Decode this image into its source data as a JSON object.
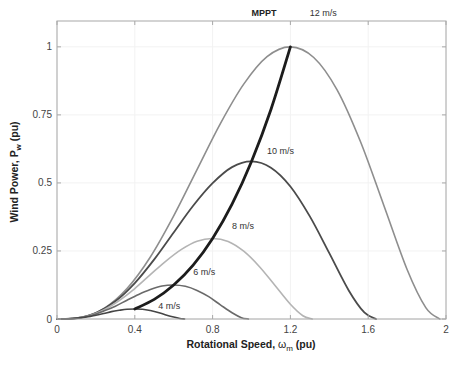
{
  "chart_data": {
    "type": "line",
    "title": "",
    "xlabel": "Rotational Speed, ω_m (pu)",
    "ylabel": "Wind Power, P_w (pu)",
    "xlabel_parts": {
      "main": "Rotational Speed, ",
      "symbol": "ω",
      "sub": "m",
      "unit": " (pu)"
    },
    "ylabel_parts": {
      "main": "Wind Power, P",
      "sub": "w",
      "unit": " (pu)"
    },
    "xlim": [
      0,
      2
    ],
    "ylim": [
      0,
      1.095
    ],
    "xticks": [
      0,
      0.4,
      0.8,
      1.2,
      1.6,
      2
    ],
    "xtick_labels": [
      "0",
      "0.4",
      "0.8",
      "1.2",
      "1.6",
      "2"
    ],
    "yticks": [
      0,
      0.25,
      0.5,
      0.75,
      1
    ],
    "ytick_labels": [
      "0",
      "0.25",
      "0.5",
      "0.75",
      "1"
    ],
    "grid": true,
    "legend": "none (inline labels)",
    "series": [
      {
        "name": "12 m/s",
        "color": "#8e8e8e",
        "width": 1.6,
        "x": [
          0,
          0.12,
          0.24,
          0.36,
          0.48,
          0.6,
          0.72,
          0.84,
          0.96,
          1.08,
          1.2,
          1.32,
          1.44,
          1.56,
          1.68,
          1.8,
          1.896,
          1.968
        ],
        "y": [
          0,
          0.005,
          0.038,
          0.112,
          0.228,
          0.379,
          0.549,
          0.718,
          0.863,
          0.964,
          1.0,
          0.961,
          0.842,
          0.652,
          0.418,
          0.182,
          0.042,
          0
        ]
      },
      {
        "name": "10 m/s",
        "color": "#4b4b4b",
        "width": 1.8,
        "x": [
          0,
          0.1,
          0.2,
          0.3,
          0.4,
          0.5,
          0.6,
          0.7,
          0.8,
          0.9,
          1.0,
          1.1,
          1.2,
          1.3,
          1.4,
          1.5,
          1.58,
          1.64
        ],
        "y": [
          0,
          0.003,
          0.022,
          0.065,
          0.132,
          0.219,
          0.318,
          0.416,
          0.499,
          0.558,
          0.579,
          0.556,
          0.487,
          0.377,
          0.242,
          0.105,
          0.024,
          0
        ]
      },
      {
        "name": "8 m/s",
        "color": "#b4b4b4",
        "width": 1.6,
        "x": [
          0,
          0.08,
          0.16,
          0.24,
          0.32,
          0.4,
          0.48,
          0.56,
          0.64,
          0.72,
          0.8,
          0.88,
          0.96,
          1.04,
          1.12,
          1.2,
          1.264,
          1.312
        ],
        "y": [
          0,
          0.002,
          0.011,
          0.033,
          0.068,
          0.112,
          0.163,
          0.213,
          0.256,
          0.286,
          0.296,
          0.285,
          0.249,
          0.193,
          0.124,
          0.054,
          0.012,
          0
        ]
      },
      {
        "name": "6 m/s",
        "color": "#6a6a6a",
        "width": 1.6,
        "x": [
          0,
          0.06,
          0.12,
          0.18,
          0.24,
          0.3,
          0.36,
          0.42,
          0.48,
          0.54,
          0.6,
          0.66,
          0.72,
          0.78,
          0.84,
          0.9,
          0.948,
          0.984
        ],
        "y": [
          0,
          0.001,
          0.005,
          0.014,
          0.029,
          0.047,
          0.069,
          0.09,
          0.108,
          0.121,
          0.125,
          0.12,
          0.105,
          0.082,
          0.052,
          0.023,
          0.005,
          0
        ]
      },
      {
        "name": "4 m/s",
        "color": "#454545",
        "width": 1.6,
        "x": [
          0,
          0.04,
          0.08,
          0.12,
          0.16,
          0.2,
          0.24,
          0.28,
          0.32,
          0.36,
          0.4,
          0.44,
          0.48,
          0.52,
          0.56,
          0.6,
          0.632,
          0.656
        ],
        "y": [
          0,
          0,
          0.001,
          0.004,
          0.008,
          0.014,
          0.02,
          0.027,
          0.032,
          0.036,
          0.037,
          0.036,
          0.031,
          0.024,
          0.015,
          0.007,
          0.002,
          0
        ]
      },
      {
        "name": "MPPT",
        "color": "#1c1c1c",
        "width": 2.8,
        "x": [
          0.4,
          0.5,
          0.6,
          0.7,
          0.8,
          0.9,
          1.0,
          1.1,
          1.2
        ],
        "y": [
          0.037,
          0.072,
          0.125,
          0.198,
          0.296,
          0.422,
          0.579,
          0.77,
          1.0
        ]
      }
    ],
    "annotations": [
      {
        "text": "MPPT",
        "x": 1.0,
        "y": 1.112,
        "bold": true
      },
      {
        "text": "12 m/s",
        "x": 1.3,
        "y": 1.112,
        "bold": false
      },
      {
        "text": "10 m/s",
        "x": 1.08,
        "y": 0.605,
        "bold": false
      },
      {
        "text": "8 m/s",
        "x": 0.9,
        "y": 0.33,
        "bold": false
      },
      {
        "text": "6 m/s",
        "x": 0.7,
        "y": 0.16,
        "bold": false
      },
      {
        "text": "4 m/s",
        "x": 0.52,
        "y": 0.035,
        "bold": false
      }
    ]
  },
  "style": {
    "axis_color": "#a8a8a8",
    "grid_color": "#f2f2f2",
    "background": "#ffffff"
  }
}
